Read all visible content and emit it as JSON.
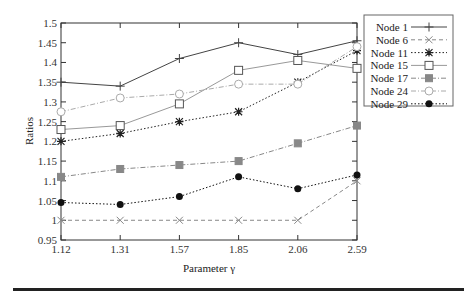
{
  "chart_data": {
    "type": "line",
    "title": "",
    "xlabel": "Parameter γ",
    "ylabel": "Ratios",
    "categories": [
      "1.12",
      "1.31",
      "1.57",
      "1.85",
      "2.06",
      "2.59"
    ],
    "ylim": [
      0.95,
      1.5
    ],
    "yticks": [
      "0.95",
      "1",
      "1.05",
      "1.1",
      "1.15",
      "1.2",
      "1.25",
      "1.3",
      "1.35",
      "1.4",
      "1.45",
      "1.5"
    ],
    "grid": false,
    "legend_position": "upper right, outside plot",
    "series": [
      {
        "name": "Node 1",
        "marker": "plus",
        "line": "solid",
        "color": "#444444",
        "values": [
          1.35,
          1.34,
          1.41,
          1.45,
          1.42,
          1.455
        ]
      },
      {
        "name": "Node 6",
        "marker": "cross",
        "line": "dashed",
        "color": "#888888",
        "values": [
          1.0,
          1.0,
          1.0,
          1.0,
          1.0,
          1.1
        ]
      },
      {
        "name": "Node 11",
        "marker": "star",
        "line": "dotted",
        "color": "#222222",
        "values": [
          1.2,
          1.22,
          1.25,
          1.275,
          1.35,
          1.43
        ]
      },
      {
        "name": "Node 15",
        "marker": "open-square",
        "line": "solid",
        "color": "#999999",
        "values": [
          1.23,
          1.24,
          1.295,
          1.38,
          1.405,
          1.385
        ]
      },
      {
        "name": "Node 17",
        "marker": "filled-square",
        "line": "dashdot",
        "color": "#888888",
        "values": [
          1.11,
          1.13,
          1.14,
          1.15,
          1.195,
          1.24
        ]
      },
      {
        "name": "Node 24",
        "marker": "open-circle",
        "line": "dashdot",
        "color": "#aaaaaa",
        "values": [
          1.275,
          1.31,
          1.32,
          1.345,
          1.345,
          1.44
        ]
      },
      {
        "name": "Node 29",
        "marker": "filled-circle",
        "line": "dotted",
        "color": "#111111",
        "values": [
          1.045,
          1.04,
          1.06,
          1.11,
          1.08,
          1.115
        ]
      }
    ]
  },
  "axes": {
    "x_title": "Parameter γ",
    "y_title": "Ratios"
  },
  "legend": {
    "items": [
      "Node 1",
      "Node 6",
      "Node 11",
      "Node 15",
      "Node 17",
      "Node 24",
      "Node 29"
    ]
  }
}
